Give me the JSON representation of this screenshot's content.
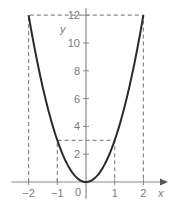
{
  "chart_data": {
    "type": "line",
    "title": "",
    "function": "y = 3x^2",
    "xlabel": "x",
    "ylabel": "y",
    "xlim": [
      -2.6,
      2.7
    ],
    "ylim": [
      -1.2,
      12.5
    ],
    "x_ticks": [
      -2,
      -1,
      0,
      1,
      2
    ],
    "x_tick_labels": [
      "−2",
      "−1",
      "0",
      "1",
      "2"
    ],
    "y_ticks": [
      2,
      4,
      6,
      8,
      10,
      12
    ],
    "y_tick_labels": [
      "2",
      "4",
      "6",
      "8",
      "10",
      "12"
    ],
    "origin_label": "0",
    "grid": false,
    "series": [
      {
        "name": "parabola",
        "x": [
          -2,
          -1.5,
          -1,
          -0.5,
          0,
          0.5,
          1,
          1.5,
          2
        ],
        "y": [
          12,
          6.75,
          3,
          0.75,
          0,
          0.75,
          3,
          6.75,
          12
        ],
        "color": "#2b2b2b"
      }
    ],
    "annotations": [
      {
        "type": "dashed-guide",
        "points": [
          [
            -2,
            0
          ],
          [
            -2,
            12
          ],
          [
            2,
            12
          ],
          [
            2,
            0
          ]
        ]
      },
      {
        "type": "dashed-guide",
        "points": [
          [
            -1,
            0
          ],
          [
            -1,
            3
          ],
          [
            1,
            3
          ],
          [
            1,
            0
          ]
        ]
      }
    ]
  },
  "colors": {
    "axis": "#8a8a8a",
    "curve": "#2b2b2b",
    "dash": "#8a8a8a",
    "text": "#7a7a7a"
  }
}
